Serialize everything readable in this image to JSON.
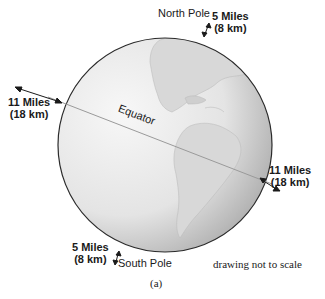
{
  "figure": {
    "caption": "(a)",
    "note": "drawing not to scale"
  },
  "globe": {
    "center": [
      165,
      145
    ],
    "radius": 107,
    "equator_label": "Equator",
    "colors": {
      "outline": "#2a2a2a",
      "fill_light": "#f2f2f2",
      "fill_dark": "#b8b8b8",
      "land": "#dcdcdc"
    }
  },
  "labels": {
    "north_pole": "North Pole",
    "south_pole": "South Pole",
    "north_bulge": {
      "miles": "5 Miles",
      "km": "(8 km)"
    },
    "south_bulge": {
      "miles": "5 Miles",
      "km": "(8 km)"
    },
    "west_bulge": {
      "miles": "11 Miles",
      "km": "(18 km)"
    },
    "east_bulge": {
      "miles": "11 Miles",
      "km": "(18 km)"
    }
  }
}
